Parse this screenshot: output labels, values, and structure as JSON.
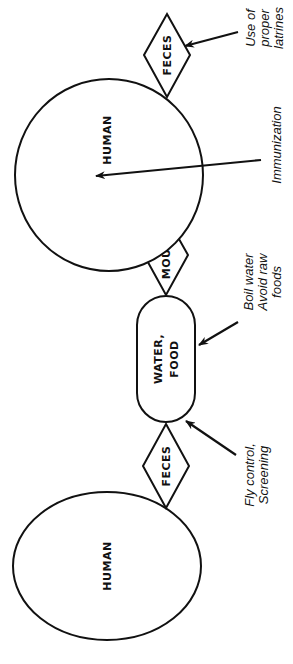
{
  "diagram": {
    "type": "disease-transmission-cycle",
    "orientation": "rotated -90deg (read bottom-to-top)",
    "nodes": [
      {
        "id": "human_source",
        "shape": "ellipse",
        "label": "HUMAN"
      },
      {
        "id": "feces_1",
        "shape": "diamond",
        "label": "FECES"
      },
      {
        "id": "water_food",
        "shape": "stadium",
        "label_lines": [
          "WATER,",
          "FOOD"
        ]
      },
      {
        "id": "mouth",
        "shape": "diamond",
        "label": "MOUTH"
      },
      {
        "id": "human_host",
        "shape": "ellipse",
        "label": "HUMAN"
      },
      {
        "id": "feces_2",
        "shape": "diamond",
        "label": "FECES"
      }
    ],
    "interventions": [
      {
        "id": "fly_control",
        "target": "feces_1 -> water_food",
        "lines": [
          "Fly control,",
          "Screening"
        ]
      },
      {
        "id": "boil_water",
        "target": "water_food",
        "lines": [
          "Boil water",
          "Avoid raw",
          "foods"
        ]
      },
      {
        "id": "immunization",
        "target": "human_host",
        "lines": [
          "Immunization"
        ]
      },
      {
        "id": "latrines",
        "target": "feces_2",
        "lines": [
          "Use of",
          "proper",
          "latrines"
        ]
      }
    ],
    "colors": {
      "stroke": "#111111",
      "background": "#ffffff"
    }
  }
}
